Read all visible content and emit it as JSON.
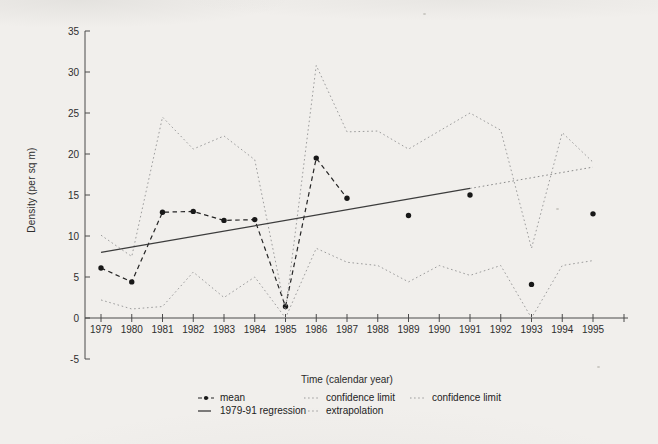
{
  "chart_data": {
    "type": "line",
    "title": "",
    "xlabel": "Time (calendar year)",
    "ylabel": "Density (per sq m)",
    "x": [
      1979,
      1980,
      1981,
      1982,
      1983,
      1984,
      1985,
      1986,
      1987,
      1988,
      1989,
      1990,
      1991,
      1992,
      1993,
      1994,
      1995
    ],
    "xlim": [
      1979,
      1995
    ],
    "ylim": [
      -5,
      35
    ],
    "yticks": [
      -5,
      0,
      5,
      10,
      15,
      20,
      25,
      30,
      35
    ],
    "grid": false,
    "series": [
      {
        "name": "mean",
        "role": "mean",
        "line_x": [
          1979,
          1980,
          1981,
          1982,
          1983,
          1984,
          1985,
          1986,
          1987
        ],
        "line_y": [
          6.1,
          4.4,
          12.9,
          13.0,
          11.9,
          12.0,
          1.4,
          19.5,
          14.6
        ],
        "isolated_x": [
          1989,
          1991,
          1993,
          1995
        ],
        "isolated_y": [
          12.5,
          15.0,
          4.1,
          12.7
        ]
      },
      {
        "name": "confidence limit (upper)",
        "role": "confidence",
        "x": [
          1979,
          1980,
          1981,
          1982,
          1983,
          1984,
          1985,
          1986,
          1987,
          1988,
          1989,
          1990,
          1991,
          1992,
          1993,
          1994,
          1995
        ],
        "y": [
          10.1,
          7.5,
          24.5,
          20.6,
          22.2,
          19.3,
          0.9,
          30.8,
          22.7,
          22.8,
          20.6,
          22.8,
          25.0,
          22.9,
          8.5,
          22.6,
          19.0
        ]
      },
      {
        "name": "confidence limit (lower)",
        "role": "confidence",
        "x": [
          1979,
          1980,
          1981,
          1982,
          1983,
          1984,
          1985,
          1986,
          1987,
          1988,
          1989,
          1990,
          1991,
          1992,
          1993,
          1994,
          1995
        ],
        "y": [
          2.2,
          1.1,
          1.4,
          5.6,
          2.5,
          5.0,
          0.0,
          8.5,
          6.8,
          6.4,
          4.4,
          6.4,
          5.2,
          6.4,
          0.0,
          6.4,
          7.0
        ]
      },
      {
        "name": "1979-91 regression",
        "role": "regression",
        "x": [
          1979,
          1991
        ],
        "y": [
          8.0,
          15.8
        ]
      },
      {
        "name": "extrapolation",
        "role": "extrapolation",
        "x": [
          1991,
          1995
        ],
        "y": [
          15.8,
          18.4
        ]
      }
    ],
    "legend": {
      "position": "bottom",
      "columns": [
        [
          {
            "style": "mean",
            "label": "mean"
          },
          {
            "style": "solid",
            "label": "1979-91 regression"
          }
        ],
        [
          {
            "style": "dotted",
            "label": "confidence limit"
          },
          {
            "style": "dotted",
            "label": "extrapolation"
          }
        ],
        [
          {
            "style": "dotted",
            "label": "confidence limit"
          }
        ]
      ]
    },
    "colors": {
      "axis": "#4a4a4a",
      "mean": "#181818",
      "regression": "#3c3c3c",
      "confidence": "#9c9c9c",
      "background": "#f1efec"
    }
  }
}
